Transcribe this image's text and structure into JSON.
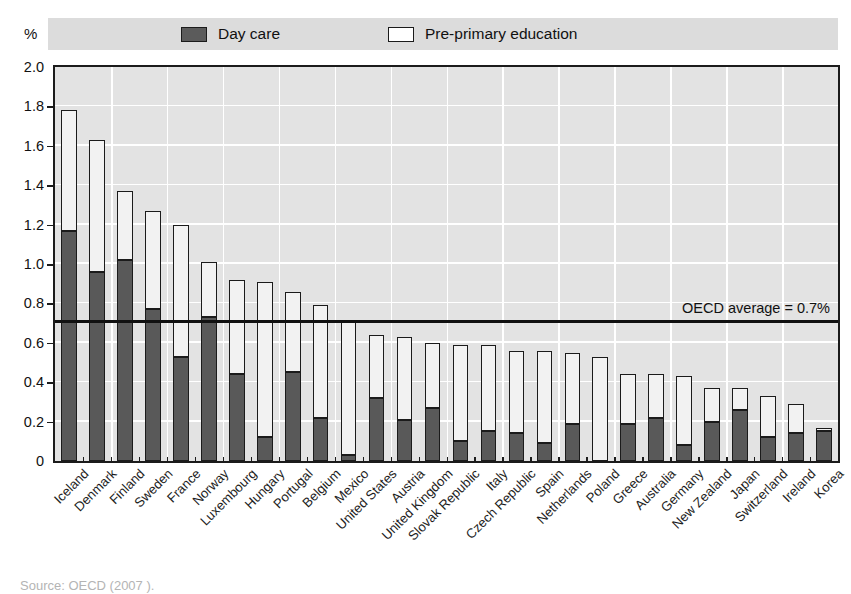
{
  "top_caption": "",
  "axis": {
    "y_unit": "%",
    "y_ticks": [
      "2.0",
      "1.8",
      "1.6",
      "1.4",
      "1.2",
      "1.0",
      "0.8",
      "0.6",
      "0.4",
      "0.2",
      "0"
    ]
  },
  "legend": {
    "items": [
      {
        "label": "Day care",
        "swatch": "dark-square-icon",
        "color": "#595959"
      },
      {
        "label": "Pre-primary education",
        "swatch": "light-square-icon",
        "color": "#ffffff"
      }
    ]
  },
  "annotation": {
    "oecd_average_label": "OECD average = 0.7%",
    "oecd_average_value": 0.7
  },
  "source": "Source: OECD (2007 ).",
  "chart_data": {
    "type": "bar",
    "stacked": true,
    "title": "",
    "subtitle": "",
    "xlabel": "",
    "ylabel": "%",
    "ylim": [
      0,
      2.0
    ],
    "ytick_step": 0.2,
    "grid": true,
    "legend_position": "top",
    "categories": [
      "Iceland",
      "Denmark",
      "Finland",
      "Sweden",
      "France",
      "Norway",
      "Luxembourg",
      "Hungary",
      "Portugal",
      "Belgium",
      "Mexico",
      "United States",
      "Austria",
      "United Kingdom",
      "Slovak Republic",
      "Italy",
      "Czech Republic",
      "Spain",
      "Netherlands",
      "Poland",
      "Greece",
      "Australia",
      "Germany",
      "New Zealand",
      "Japan",
      "Switzerland",
      "Ireland",
      "Korea"
    ],
    "series": [
      {
        "name": "Day care",
        "color": "#595959",
        "values": [
          1.17,
          0.96,
          1.02,
          0.77,
          0.53,
          0.73,
          0.44,
          0.12,
          0.45,
          0.22,
          0.03,
          0.32,
          0.21,
          0.27,
          0.1,
          0.15,
          0.14,
          0.09,
          0.19,
          0.0,
          0.19,
          0.22,
          0.08,
          0.2,
          0.26,
          0.12,
          0.14,
          0.15
        ]
      },
      {
        "name": "Pre-primary education",
        "color": "#f2f2f2",
        "values": [
          0.61,
          0.67,
          0.35,
          0.5,
          0.67,
          0.28,
          0.48,
          0.79,
          0.41,
          0.57,
          0.68,
          0.32,
          0.42,
          0.33,
          0.49,
          0.44,
          0.42,
          0.47,
          0.36,
          0.53,
          0.25,
          0.22,
          0.35,
          0.17,
          0.11,
          0.21,
          0.15,
          0.02
        ]
      }
    ],
    "totals": [
      1.78,
      1.63,
      1.37,
      1.27,
      1.2,
      1.01,
      0.92,
      0.91,
      0.86,
      0.79,
      0.71,
      0.64,
      0.63,
      0.6,
      0.59,
      0.59,
      0.56,
      0.56,
      0.55,
      0.53,
      0.44,
      0.44,
      0.43,
      0.37,
      0.37,
      0.33,
      0.29,
      0.17
    ],
    "reference_line": {
      "label": "OECD average = 0.7%",
      "value": 0.7
    }
  }
}
